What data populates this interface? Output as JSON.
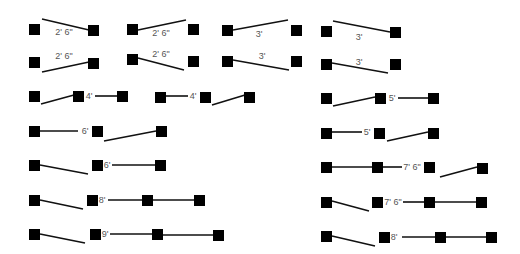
{
  "diagram": {
    "colors": {
      "square": "#000000",
      "line": "#111111",
      "label": "#555555",
      "background": "#ffffff"
    },
    "square_size": 11,
    "squares": [
      [
        29,
        24
      ],
      [
        88,
        25
      ],
      [
        127,
        24
      ],
      [
        188,
        24
      ],
      [
        222,
        25
      ],
      [
        291,
        25
      ],
      [
        321,
        26
      ],
      [
        390,
        27
      ],
      [
        29,
        57
      ],
      [
        88,
        58
      ],
      [
        127,
        54
      ],
      [
        188,
        56
      ],
      [
        222,
        56
      ],
      [
        291,
        56
      ],
      [
        321,
        59
      ],
      [
        390,
        59
      ],
      [
        29,
        91
      ],
      [
        73,
        91
      ],
      [
        117,
        91
      ],
      [
        155,
        92
      ],
      [
        200,
        92
      ],
      [
        244,
        92
      ],
      [
        321,
        93
      ],
      [
        375,
        93
      ],
      [
        428,
        93
      ],
      [
        29,
        126
      ],
      [
        92,
        126
      ],
      [
        156,
        126
      ],
      [
        321,
        128
      ],
      [
        374,
        128
      ],
      [
        428,
        128
      ],
      [
        29,
        160
      ],
      [
        92,
        160
      ],
      [
        155,
        160
      ],
      [
        321,
        162
      ],
      [
        372,
        162
      ],
      [
        424,
        162
      ],
      [
        477,
        163
      ],
      [
        29,
        195
      ],
      [
        87,
        195
      ],
      [
        142,
        195
      ],
      [
        194,
        195
      ],
      [
        321,
        197
      ],
      [
        372,
        197
      ],
      [
        424,
        197
      ],
      [
        476,
        197
      ],
      [
        29,
        229
      ],
      [
        90,
        229
      ],
      [
        152,
        229
      ],
      [
        213,
        230
      ],
      [
        321,
        231
      ],
      [
        379,
        232
      ],
      [
        435,
        232
      ],
      [
        486,
        232
      ]
    ],
    "lines": [
      [
        42,
        19,
        89,
        30
      ],
      [
        138,
        30,
        186,
        20
      ],
      [
        233,
        30,
        288,
        20
      ],
      [
        333,
        21,
        390,
        32
      ],
      [
        42,
        72,
        89,
        62
      ],
      [
        138,
        58,
        184,
        70
      ],
      [
        233,
        60,
        289,
        70
      ],
      [
        332,
        63,
        388,
        73
      ],
      [
        41,
        104,
        74,
        95
      ],
      [
        95,
        96,
        117,
        96
      ],
      [
        166,
        96,
        188,
        96
      ],
      [
        212,
        105,
        245,
        95
      ],
      [
        333,
        106,
        375,
        97
      ],
      [
        398,
        98,
        428,
        98
      ],
      [
        40,
        131,
        78,
        131
      ],
      [
        104,
        141,
        156,
        131
      ],
      [
        332,
        132,
        362,
        132
      ],
      [
        387,
        141,
        428,
        132
      ],
      [
        40,
        165,
        88,
        174
      ],
      [
        112,
        165,
        155,
        165
      ],
      [
        332,
        167,
        373,
        167
      ],
      [
        383,
        167,
        402,
        167
      ],
      [
        440,
        177,
        477,
        167
      ],
      [
        40,
        200,
        83,
        209
      ],
      [
        108,
        200,
        142,
        200
      ],
      [
        153,
        200,
        194,
        200
      ],
      [
        332,
        201,
        369,
        211
      ],
      [
        403,
        202,
        425,
        202
      ],
      [
        435,
        202,
        476,
        202
      ],
      [
        40,
        234,
        85,
        243
      ],
      [
        110,
        234,
        152,
        234
      ],
      [
        163,
        235,
        213,
        235
      ],
      [
        332,
        236,
        375,
        246
      ],
      [
        402,
        237,
        436,
        237
      ],
      [
        445,
        237,
        486,
        237
      ]
    ],
    "labels": [
      {
        "text": "2' 6\"",
        "x": 64,
        "y": 35
      },
      {
        "text": "2' 6\"",
        "x": 161,
        "y": 36
      },
      {
        "text": "3'",
        "x": 259,
        "y": 37
      },
      {
        "text": "3'",
        "x": 359,
        "y": 40
      },
      {
        "text": "2' 6\"",
        "x": 64,
        "y": 59
      },
      {
        "text": "2' 6\"",
        "x": 161,
        "y": 57
      },
      {
        "text": "3'",
        "x": 262,
        "y": 59
      },
      {
        "text": "3'",
        "x": 359,
        "y": 65
      },
      {
        "text": "4'",
        "x": 89,
        "y": 99
      },
      {
        "text": "4'",
        "x": 193,
        "y": 99
      },
      {
        "text": "5'",
        "x": 392,
        "y": 101
      },
      {
        "text": "6'",
        "x": 85,
        "y": 134
      },
      {
        "text": "5'",
        "x": 367,
        "y": 135
      },
      {
        "text": "6'",
        "x": 107,
        "y": 168
      },
      {
        "text": "7' 6\"",
        "x": 412,
        "y": 170
      },
      {
        "text": "8'",
        "x": 102,
        "y": 203
      },
      {
        "text": "7' 6\"",
        "x": 393,
        "y": 205
      },
      {
        "text": "9'",
        "x": 105,
        "y": 237
      },
      {
        "text": "8'",
        "x": 394,
        "y": 240
      }
    ]
  }
}
